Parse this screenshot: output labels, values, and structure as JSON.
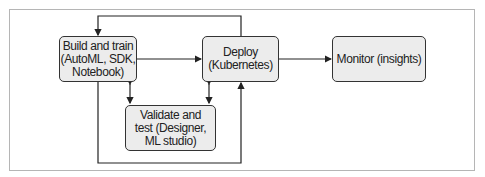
{
  "diagram": {
    "nodes": [
      {
        "id": "build",
        "label": "Build and train (AutoML, SDK, Notebook)",
        "lines": [
          "Build and train",
          "(AutoML, SDK,",
          "Notebook)"
        ]
      },
      {
        "id": "deploy",
        "label": "Deploy (Kubernetes)",
        "lines": [
          "Deploy",
          "(Kubernetes)"
        ]
      },
      {
        "id": "monitor",
        "label": "Monitor (insights)",
        "lines": [
          "Monitor (insights)"
        ]
      },
      {
        "id": "validate",
        "label": "Validate and test (Designer, ML studio)",
        "lines": [
          "Validate and",
          "test (Designer,",
          "ML studio)"
        ]
      }
    ],
    "edges": [
      {
        "from": "build",
        "to": "deploy",
        "type": "arrow"
      },
      {
        "from": "deploy",
        "to": "monitor",
        "type": "arrow"
      },
      {
        "from": "deploy",
        "to": "build",
        "type": "arrow",
        "route": "over-top"
      },
      {
        "from": "build",
        "to": "validate",
        "type": "bidirectional"
      },
      {
        "from": "deploy",
        "to": "validate",
        "type": "bidirectional"
      },
      {
        "from": "build",
        "to": "deploy",
        "type": "arrow",
        "route": "under-bottom"
      }
    ]
  }
}
